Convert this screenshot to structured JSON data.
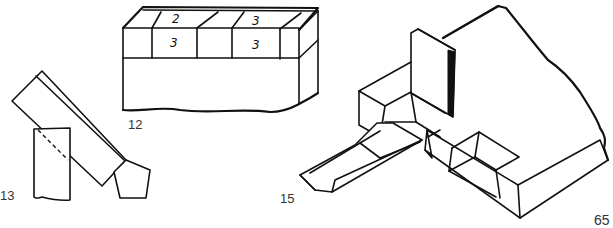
{
  "page": {
    "number": "65",
    "colors": {
      "ink": "#111111",
      "label": "#333333",
      "paper": "#ffffff"
    }
  },
  "figures": [
    {
      "id": "fig-12",
      "label": "12",
      "description": "Block with two rows of segmented cells on top; handwritten numbers on cells",
      "cell_marks": {
        "top_left": "2",
        "front_left": "3",
        "top_right": "3",
        "front_right": "3"
      }
    },
    {
      "id": "fig-13",
      "label": "13",
      "description": "Angled board resting against an upright block with dashed hidden line and pentagonal end piece"
    },
    {
      "id": "fig-15",
      "label": "15",
      "description": "Isometric view of a large block with upright post, recessed slots and a sliding tapered tongue"
    }
  ]
}
